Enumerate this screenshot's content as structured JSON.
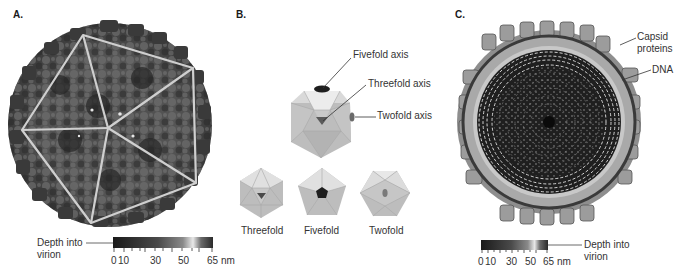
{
  "figure": {
    "panels": [
      {
        "id": "A",
        "label": "A.",
        "description": "Surface-rendered icosahedral virion with overlaid triangular faces",
        "scale": {
          "title_line1": "Depth into",
          "title_line2": "virion",
          "ticks": [
            "0",
            "10",
            "30",
            "50",
            "65 nm"
          ],
          "range_nm": [
            0,
            65
          ]
        }
      },
      {
        "id": "B",
        "label": "B.",
        "callouts": {
          "fivefold": "Fivefold axis",
          "threefold": "Threefold axis",
          "twofold": "Twofold axis"
        },
        "views": [
          {
            "label": "Threefold"
          },
          {
            "label": "Fivefold"
          },
          {
            "label": "Twofold"
          }
        ]
      },
      {
        "id": "C",
        "label": "C.",
        "description": "Cross-section of virion showing capsid shell and packed DNA",
        "callouts": {
          "capsid_line1": "Capsid",
          "capsid_line2": "proteins",
          "dna": "DNA"
        },
        "scale": {
          "title_line1": "Depth into",
          "title_line2": "virion",
          "ticks": [
            "0",
            "10",
            "30",
            "50",
            "65 nm"
          ],
          "range_nm": [
            0,
            65
          ]
        }
      }
    ],
    "colors": {
      "background": "#ffffff",
      "virion_dark": "#2e2e2e",
      "virion_mid": "#6a6a6a",
      "face_lines": "#c9c9c9",
      "icosa_face": "#b8b8b8",
      "icosa_light": "#e2e2e2",
      "marker": "#1e1e1e"
    }
  }
}
